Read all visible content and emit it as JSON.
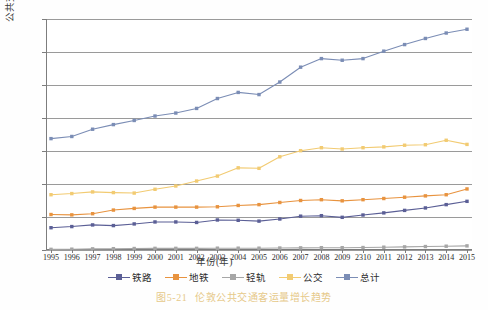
{
  "figure": {
    "caption_number": "图5-21",
    "caption_text": "伦敦公共交通客运量增长趋势"
  },
  "axes": {
    "y_title": "公共交通客运量(百万人)",
    "x_title": "年份(年)",
    "y_ticks": [
      "0",
      "2",
      "4",
      "6",
      "8",
      "10",
      "12",
      "14"
    ],
    "x_ticks": [
      "1995",
      "1996",
      "1997",
      "1998",
      "1999",
      "2000",
      "2001",
      "2002",
      "2003",
      "2004",
      "2005",
      "2006",
      "2007",
      "2008",
      "2009",
      "2⁠310",
      "2011",
      "2012",
      "2013",
      "2014",
      "2015"
    ]
  },
  "legend": {
    "items": [
      {
        "label": "铁路",
        "color": "#5b5f96"
      },
      {
        "label": "地铁",
        "color": "#e8933f"
      },
      {
        "label": "轻轨",
        "color": "#a6a6a6"
      },
      {
        "label": "公交",
        "color": "#f2cb72"
      },
      {
        "label": "总计",
        "color": "#7b8db5"
      }
    ]
  },
  "colors": {
    "grid": "#9a9a9a",
    "axis": "#7d7d7d",
    "background": "#ffffff",
    "caption": "#e6c98a"
  },
  "chart_data": {
    "type": "line",
    "title": "伦敦公共交通客运量增长趋势",
    "xlabel": "年份(年)",
    "ylabel": "公共交通客运量(百万人)",
    "xlim": [
      1995,
      2015
    ],
    "ylim": [
      0,
      14
    ],
    "ytick_step": 2,
    "grid": true,
    "legend_position": "bottom",
    "x": [
      1995,
      1996,
      1997,
      1998,
      1999,
      2000,
      2001,
      2002,
      2003,
      2004,
      2005,
      2006,
      2007,
      2008,
      2009,
      2010,
      2011,
      2012,
      2013,
      2014,
      2015
    ],
    "series": [
      {
        "name": "铁路",
        "color": "#5b5f96",
        "values": [
          1.35,
          1.42,
          1.52,
          1.48,
          1.58,
          1.7,
          1.7,
          1.67,
          1.82,
          1.8,
          1.75,
          1.88,
          2.05,
          2.08,
          1.98,
          2.12,
          2.25,
          2.4,
          2.55,
          2.75,
          2.95
        ]
      },
      {
        "name": "地铁",
        "color": "#e8933f",
        "values": [
          2.15,
          2.13,
          2.2,
          2.42,
          2.52,
          2.6,
          2.6,
          2.6,
          2.62,
          2.7,
          2.75,
          2.88,
          3.0,
          3.05,
          2.98,
          3.05,
          3.12,
          3.2,
          3.28,
          3.35,
          3.7
        ]
      },
      {
        "name": "轻轨",
        "color": "#a6a6a6",
        "values": [
          0.04,
          0.05,
          0.07,
          0.08,
          0.09,
          0.1,
          0.1,
          0.1,
          0.11,
          0.11,
          0.11,
          0.12,
          0.13,
          0.14,
          0.14,
          0.15,
          0.17,
          0.19,
          0.21,
          0.23,
          0.25
        ]
      },
      {
        "name": "公交",
        "color": "#f2cb72",
        "values": [
          3.35,
          3.42,
          3.52,
          3.48,
          3.45,
          3.68,
          3.88,
          4.18,
          4.48,
          4.98,
          4.95,
          5.65,
          6.02,
          6.2,
          6.12,
          6.2,
          6.25,
          6.35,
          6.38,
          6.65,
          6.4
        ]
      },
      {
        "name": "总计",
        "color": "#7b8db5",
        "values": [
          6.75,
          6.88,
          7.32,
          7.6,
          7.85,
          8.12,
          8.3,
          8.58,
          9.18,
          9.55,
          9.42,
          10.18,
          11.08,
          11.6,
          11.5,
          11.6,
          12.05,
          12.45,
          12.82,
          13.15,
          13.38
        ]
      }
    ]
  }
}
